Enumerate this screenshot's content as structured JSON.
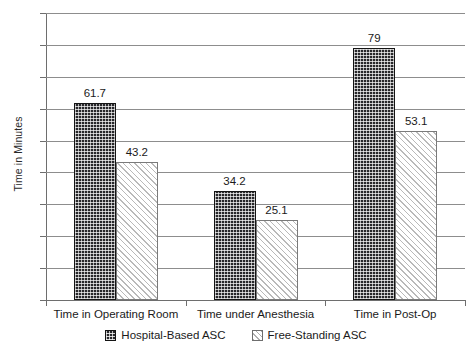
{
  "chart_data": {
    "type": "bar",
    "title": "",
    "xlabel": "",
    "ylabel": "Time in Minutes",
    "ylim": [
      0,
      90
    ],
    "ytick_step": 10,
    "yticks": [
      90,
      80,
      70,
      60,
      50,
      40,
      30,
      20,
      10,
      0
    ],
    "ytick_labels": [
      "90",
      "80",
      "70",
      "60",
      "50",
      "40",
      "30",
      "20",
      "10",
      "0"
    ],
    "grid": true,
    "grid_axis": "y",
    "legend_position": "bottom-center",
    "categories": [
      "Time in Operating Room",
      "Time under Anesthesia",
      "Time in Post-Op"
    ],
    "series": [
      {
        "name": "Hospital-Based ASC",
        "values": [
          61.7,
          34.2,
          79
        ],
        "value_labels": [
          "61.7",
          "34.2",
          "79"
        ],
        "fill": "dark-dotted",
        "color": "#27272a"
      },
      {
        "name": "Free-Standing ASC",
        "values": [
          43.2,
          25.1,
          53.1
        ],
        "value_labels": [
          "43.2",
          "25.1",
          "53.1"
        ],
        "fill": "light-diagonal-hatch",
        "color": "#ffffff"
      }
    ]
  },
  "legend": {
    "items": [
      {
        "label": "Hospital-Based ASC",
        "swatch": "dark-dotted-swatch-icon"
      },
      {
        "label": "Free-Standing ASC",
        "swatch": "diagonal-hatch-swatch-icon"
      }
    ]
  }
}
